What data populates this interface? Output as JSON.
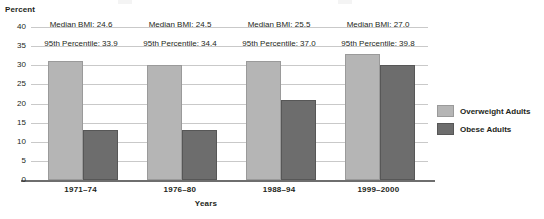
{
  "chart_data": {
    "type": "bar",
    "title": "",
    "xlabel": "Years",
    "ylabel": "Percent",
    "categories": [
      "1971–74",
      "1976–80",
      "1988–94",
      "1999–2000"
    ],
    "series": [
      {
        "name": "Overweight Adults",
        "color": "#b5b5b5",
        "values": [
          31,
          30,
          31,
          33
        ]
      },
      {
        "name": "Obese Adults",
        "color": "#6d6d6d",
        "values": [
          13,
          13,
          21,
          30
        ]
      }
    ],
    "ylim": [
      0,
      40
    ],
    "yticks": [
      "0",
      "5",
      "10",
      "15",
      "20",
      "25",
      "30",
      "35",
      "40"
    ],
    "grid": true,
    "legend_position": "right",
    "annotations": [
      {
        "median_label": "Median BMI: 24.6",
        "percentile_label": "95th Percentile: 33.9"
      },
      {
        "median_label": "Median BMI: 24.5",
        "percentile_label": "95th Percentile: 34.4"
      },
      {
        "median_label": "Median BMI: 25.5",
        "percentile_label": "95th Percentile: 37.0"
      },
      {
        "median_label": "Median BMI: 27.0",
        "percentile_label": "95th Percentile: 39.8"
      }
    ]
  }
}
